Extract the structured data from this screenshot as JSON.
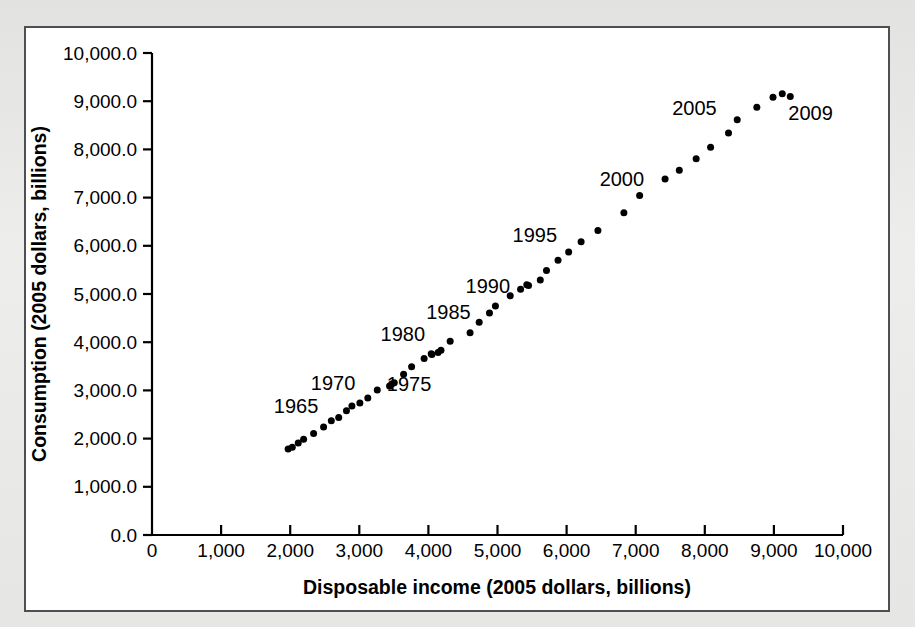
{
  "figure": {
    "background_color": "#e9e9e7",
    "panel_color": "#ffffff",
    "border_color": "#4d4f52",
    "marker_color": "#000000"
  },
  "chart_data": {
    "type": "scatter",
    "title": "",
    "xlabel": "Disposable income (2005 dollars, billions)",
    "ylabel": "Consumption (2005 dollars, billions)",
    "xlim": [
      0,
      10000
    ],
    "ylim": [
      0,
      10000
    ],
    "xticks": [
      0,
      1000,
      2000,
      3000,
      4000,
      5000,
      6000,
      7000,
      8000,
      9000,
      10000
    ],
    "xtick_labels": [
      "0",
      "1,000",
      "2,000",
      "3,000",
      "4,000",
      "5,000",
      "6,000",
      "7,000",
      "8,000",
      "9,000",
      "10,000"
    ],
    "yticks": [
      0,
      1000,
      2000,
      3000,
      4000,
      5000,
      6000,
      7000,
      8000,
      9000,
      10000
    ],
    "ytick_labels": [
      "0.0",
      "1,000.0",
      "2,000.0",
      "3,000.0",
      "4,000.0",
      "5,000.0",
      "6,000.0",
      "7,000.0",
      "8,000.0",
      "9,000.0",
      "10,000.0"
    ],
    "grid": false,
    "legend": false,
    "marker_size": 7,
    "points": [
      {
        "year": 1960,
        "x": 1970,
        "y": 1784
      },
      {
        "year": 1961,
        "x": 2030,
        "y": 1821
      },
      {
        "year": 1962,
        "x": 2116,
        "y": 1911
      },
      {
        "year": 1963,
        "x": 2194,
        "y": 1989
      },
      {
        "year": 1964,
        "x": 2339,
        "y": 2108
      },
      {
        "year": 1965,
        "x": 2483,
        "y": 2241
      },
      {
        "year": 1966,
        "x": 2595,
        "y": 2369
      },
      {
        "year": 1967,
        "x": 2702,
        "y": 2440
      },
      {
        "year": 1968,
        "x": 2814,
        "y": 2580
      },
      {
        "year": 1969,
        "x": 2893,
        "y": 2677
      },
      {
        "year": 1970,
        "x": 3008,
        "y": 2741
      },
      {
        "year": 1971,
        "x": 3123,
        "y": 2841
      },
      {
        "year": 1972,
        "x": 3260,
        "y": 3007
      },
      {
        "year": 1973,
        "x": 3469,
        "y": 3132
      },
      {
        "year": 1974,
        "x": 3438,
        "y": 3093
      },
      {
        "year": 1975,
        "x": 3506,
        "y": 3160
      },
      {
        "year": 1976,
        "x": 3641,
        "y": 3336
      },
      {
        "year": 1977,
        "x": 3757,
        "y": 3493
      },
      {
        "year": 1978,
        "x": 3938,
        "y": 3663
      },
      {
        "year": 1979,
        "x": 4041,
        "y": 3759
      },
      {
        "year": 1980,
        "x": 4050,
        "y": 3747
      },
      {
        "year": 1981,
        "x": 4140,
        "y": 3786
      },
      {
        "year": 1982,
        "x": 4182,
        "y": 3835
      },
      {
        "year": 1983,
        "x": 4315,
        "y": 4018
      },
      {
        "year": 1984,
        "x": 4603,
        "y": 4196
      },
      {
        "year": 1985,
        "x": 4735,
        "y": 4413
      },
      {
        "year": 1986,
        "x": 4884,
        "y": 4607
      },
      {
        "year": 1987,
        "x": 4970,
        "y": 4751
      },
      {
        "year": 1988,
        "x": 5184,
        "y": 4963
      },
      {
        "year": 1989,
        "x": 5334,
        "y": 5096
      },
      {
        "year": 1990,
        "x": 5424,
        "y": 5191
      },
      {
        "year": 1991,
        "x": 5449,
        "y": 5174
      },
      {
        "year": 1992,
        "x": 5619,
        "y": 5293
      },
      {
        "year": 1993,
        "x": 5709,
        "y": 5487
      },
      {
        "year": 1994,
        "x": 5876,
        "y": 5700
      },
      {
        "year": 1995,
        "x": 6030,
        "y": 5870
      },
      {
        "year": 1996,
        "x": 6210,
        "y": 6085
      },
      {
        "year": 1997,
        "x": 6453,
        "y": 6318
      },
      {
        "year": 1998,
        "x": 6829,
        "y": 6684
      },
      {
        "year": 1999,
        "x": 7057,
        "y": 7041
      },
      {
        "year": 2000,
        "x": 7425,
        "y": 7386
      },
      {
        "year": 2001,
        "x": 7631,
        "y": 7570
      },
      {
        "year": 2002,
        "x": 7875,
        "y": 7804
      },
      {
        "year": 2003,
        "x": 8084,
        "y": 8045
      },
      {
        "year": 2004,
        "x": 8343,
        "y": 8338
      },
      {
        "year": 2005,
        "x": 8469,
        "y": 8615
      },
      {
        "year": 2006,
        "x": 8753,
        "y": 8876
      },
      {
        "year": 2007,
        "x": 8987,
        "y": 9081
      },
      {
        "year": 2008,
        "x": 9121,
        "y": 9155
      },
      {
        "year": 2009,
        "x": 9237,
        "y": 9100
      }
    ],
    "annotations": [
      {
        "label": "1965",
        "x": 2085,
        "y": 2540
      },
      {
        "label": "1970",
        "x": 2620,
        "y": 3000
      },
      {
        "label": "1975",
        "x": 3720,
        "y": 2980
      },
      {
        "label": "1980",
        "x": 3630,
        "y": 4030
      },
      {
        "label": "1985",
        "x": 4290,
        "y": 4480
      },
      {
        "label": "1990",
        "x": 4860,
        "y": 5030
      },
      {
        "label": "1995",
        "x": 5540,
        "y": 6080
      },
      {
        "label": "2000",
        "x": 6800,
        "y": 7240
      },
      {
        "label": "2005",
        "x": 7850,
        "y": 8720
      },
      {
        "label": "2009",
        "x": 9530,
        "y": 8600
      }
    ]
  }
}
